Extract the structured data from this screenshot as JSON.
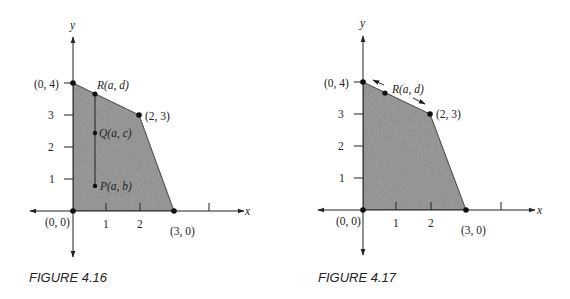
{
  "figures": [
    {
      "caption": "FIGURE 4.16",
      "axis_labels": {
        "x": "x",
        "y": "y"
      },
      "x_ticks": [
        "1",
        "2"
      ],
      "y_ticks": [
        "1",
        "2",
        "3"
      ],
      "vertices": {
        "origin": "(0, 0)",
        "top": "(0, 4)",
        "corner": "(2, 3)",
        "right": "(3, 0)"
      },
      "points": {
        "R": "R(a, d)",
        "Q": "Q(a, c)",
        "P": "P(a, b)"
      }
    },
    {
      "caption": "FIGURE 4.17",
      "axis_labels": {
        "x": "x",
        "y": "y"
      },
      "x_ticks": [
        "1",
        "2"
      ],
      "y_ticks": [
        "1",
        "2",
        "3"
      ],
      "vertices": {
        "origin": "(0, 0)",
        "top": "(0, 4)",
        "corner": "(2, 3)",
        "right": "(3, 0)"
      },
      "points": {
        "R": "R(a, d)"
      }
    }
  ],
  "colors": {
    "region_fill": "#8f8f8f",
    "line": "#222222"
  }
}
